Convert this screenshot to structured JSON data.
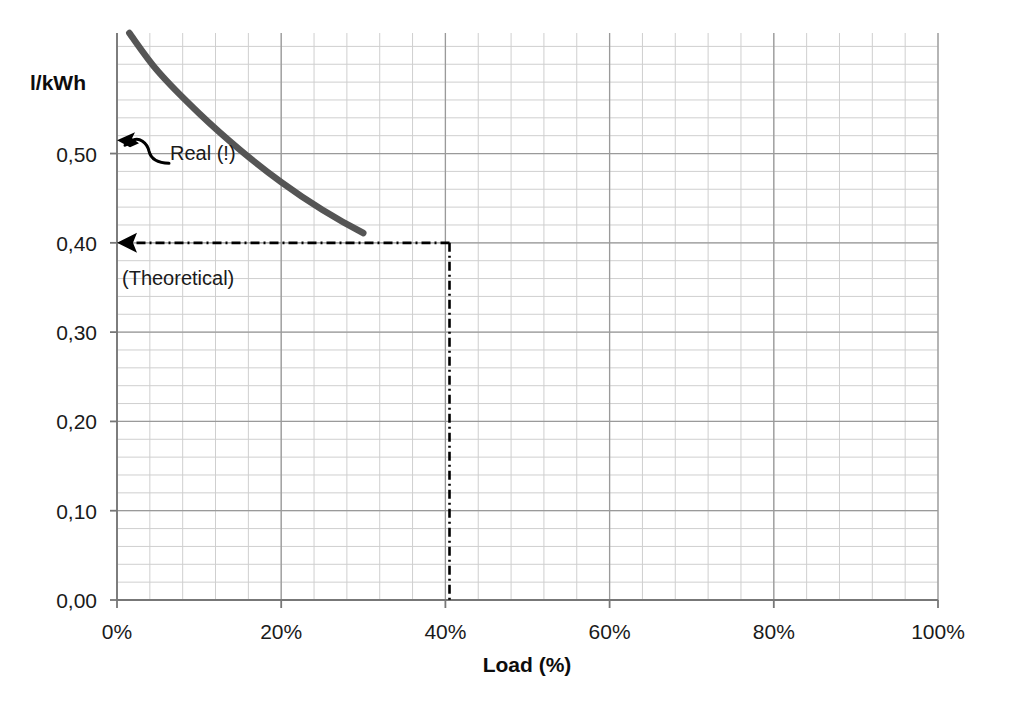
{
  "chart_data": {
    "type": "line",
    "title": "",
    "subtitle": "",
    "xlabel": "Load (%)",
    "ylabel": "l/kWh",
    "xlim": [
      0,
      100
    ],
    "ylim": [
      0.0,
      0.635
    ],
    "grid": true,
    "minor_grid": true,
    "legend": "none",
    "x_ticks": [
      "0%",
      "20%",
      "40%",
      "60%",
      "80%",
      "100%"
    ],
    "x_tick_values": [
      0,
      20,
      40,
      60,
      80,
      100
    ],
    "y_ticks": [
      "0,00",
      "0,10",
      "0,20",
      "0,30",
      "0,40",
      "0,50"
    ],
    "y_tick_values": [
      0.0,
      0.1,
      0.2,
      0.3,
      0.4,
      0.5
    ],
    "x_minor_step": 4,
    "y_minor_step": 0.02,
    "series": [
      {
        "name": "Specific fuel consumption",
        "color": "#555555",
        "x": [
          1.5,
          5,
          10,
          15,
          20,
          25,
          30,
          35,
          40.5,
          45,
          50,
          55,
          60,
          65,
          70,
          75,
          80,
          85,
          90,
          95,
          100
        ],
        "y": [
          0.635,
          0.592,
          0.545,
          0.504,
          0.468,
          0.437,
          0.411,
          0.39,
          0.4,
          0.361,
          0.348,
          0.339,
          0.332,
          0.326,
          0.321,
          0.317,
          0.314,
          0.312,
          0.311,
          0.31,
          0.31
        ]
      }
    ],
    "annotations": [
      {
        "id": "real-annotation",
        "label": "Real (!)",
        "kind": "curly-arrow",
        "points_to_value": 0.515,
        "text_x": 170,
        "text_y": 160,
        "description": "Hand-drawn squiggly arrow pointing left to the y-axis at approximately 0.52"
      },
      {
        "id": "theoretical-annotation",
        "label": "(Theoretical)",
        "kind": "dash-dot-leader",
        "x_value": 40.5,
        "y_value": 0.4,
        "text_x": 122,
        "text_y": 285,
        "description": "Horizontal dash-dot arrow from the curve at 40.5% load to the 0,40 y-axis tick, plus a vertical dash-dot drop line down to the x-axis"
      }
    ]
  },
  "geometry": {
    "plot_left": 117,
    "plot_right": 938,
    "plot_top": 33,
    "plot_bottom": 600
  },
  "labels": {
    "y_axis_title": "l/kWh",
    "x_axis_title": "Load (%)",
    "y_ticks": [
      "0,50",
      "0,40",
      "0,30",
      "0,20",
      "0,10",
      "0,00"
    ],
    "x_ticks": [
      "0%",
      "20%",
      "40%",
      "60%",
      "80%",
      "100%"
    ],
    "real_annotation": "Real (!)",
    "theoretical_annotation": "(Theoretical)"
  },
  "colors": {
    "curve": "#555555",
    "major_grid": "#9a9a9a",
    "minor_grid": "#cfcfcf",
    "axis": "#777777",
    "text": "#1a1a1a",
    "annotation": "#000000",
    "background": "#ffffff"
  }
}
